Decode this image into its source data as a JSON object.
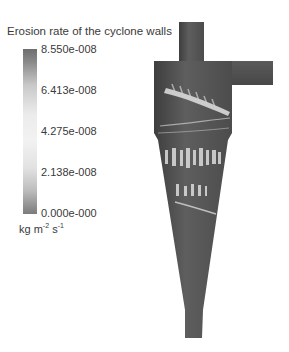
{
  "figure": {
    "title": "Erosion rate of the cyclone walls",
    "colorbar": {
      "ticks": [
        "8.550e-008",
        "6.413e-008",
        "4.275e-008",
        "2.138e-008",
        "0.000e-000"
      ],
      "units_base": "kg m",
      "units_exp1": "-2",
      "units_mid": " s",
      "units_exp2": "-1",
      "colors": {
        "low": "#7b7b7b",
        "mid": "#f2f2f2",
        "high": "#6e6e6e"
      }
    },
    "geometry": {
      "parts": [
        "vortex-finder",
        "tangential-inlet",
        "cylinder-body",
        "cone",
        "dust-outlet"
      ],
      "wall_color": "#5a5a5a",
      "highlight_color": "#e8e8e8"
    }
  }
}
